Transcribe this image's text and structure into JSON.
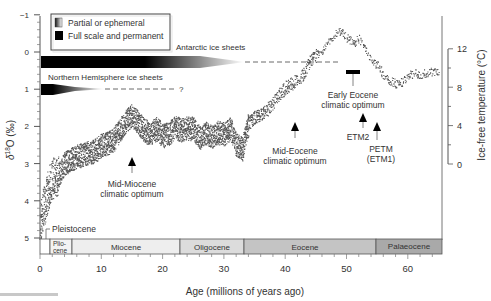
{
  "chart_data": {
    "type": "scatter",
    "title": "",
    "xlabel": "Age (millions of years ago)",
    "ylabel": "δ18O (‰)",
    "y2label": "Ice-free temperature (°C)",
    "xlim": [
      0,
      65.5
    ],
    "ylim": [
      5,
      -1
    ],
    "y2lim": [
      0,
      12
    ],
    "x_ticks": [
      0,
      10,
      20,
      30,
      40,
      50,
      60
    ],
    "y_ticks": [
      -1,
      0,
      1,
      2,
      3,
      4,
      5
    ],
    "y2_ticks": [
      0,
      4,
      8,
      12
    ],
    "grid": false,
    "legend": {
      "position": "upper-left",
      "entries": [
        {
          "label": "Partial or ephemeral",
          "symbol": "gradient-box"
        },
        {
          "label": "Full scale and permanent",
          "symbol": "black-box"
        }
      ]
    },
    "series": [
      {
        "name": "Benthic δ18O composite",
        "x": [
          0,
          0.5,
          1,
          1.5,
          2,
          3,
          4,
          5,
          6,
          7,
          8,
          9,
          10,
          11,
          12,
          13,
          14,
          15,
          16,
          17,
          18,
          19,
          20,
          21,
          22,
          23,
          24,
          25,
          26,
          27,
          28,
          29,
          30,
          31,
          32,
          33,
          34,
          35,
          36,
          37,
          38,
          39,
          40,
          41,
          42,
          43,
          44,
          45,
          46,
          47,
          48,
          49,
          50,
          51,
          52,
          53,
          54,
          55,
          56,
          57,
          58,
          59,
          60,
          61,
          62,
          63,
          64,
          65
        ],
        "values": [
          4.6,
          4.2,
          3.9,
          3.6,
          3.4,
          3.3,
          3.0,
          2.9,
          2.8,
          2.75,
          2.7,
          2.65,
          2.5,
          2.45,
          2.35,
          2.1,
          1.85,
          1.7,
          1.9,
          2.1,
          2.2,
          2.05,
          2.25,
          2.2,
          2.0,
          2.1,
          2.05,
          2.05,
          2.3,
          2.15,
          2.3,
          2.15,
          2.2,
          2.05,
          2.5,
          2.6,
          1.9,
          1.75,
          1.7,
          1.55,
          1.35,
          1.15,
          0.95,
          0.85,
          0.75,
          0.6,
          0.25,
          0.1,
          -0.05,
          -0.25,
          -0.45,
          -0.55,
          -0.4,
          -0.25,
          -0.35,
          -0.1,
          0.2,
          0.35,
          0.6,
          0.75,
          0.85,
          0.8,
          0.65,
          0.55,
          0.6,
          0.55,
          0.5,
          0.55
        ]
      }
    ],
    "ice_sheets": [
      {
        "label": "Antarctic ice sheets",
        "full_scale_from": 0,
        "full_scale_to": 26,
        "ephemeral_to": 34,
        "dashed_to": 49,
        "y_delta": 0.3
      },
      {
        "label": "Northern Hemisphere ice sheets",
        "full_scale_from": 0,
        "full_scale_to": 2.7,
        "ephemeral_to": 10,
        "dashed_to": 23,
        "y_delta": 0.85,
        "uncertain_marker": "?"
      }
    ],
    "bar_marker": {
      "label": "Early Eocene climatic optimum",
      "x_from": 50.5,
      "x_to": 53,
      "y": 0.5
    },
    "annotations": [
      {
        "text": "Mid-Miocene climatic optimum",
        "x": 15,
        "arrow": true
      },
      {
        "text": "Mid-Eocene climatic optimum",
        "x": 41.5,
        "arrow": true
      },
      {
        "text": "Early Eocene climatic optimum",
        "x": 51.5,
        "arrow": false
      },
      {
        "text": "ETM2",
        "x": 53.5,
        "arrow": true
      },
      {
        "text": "PETM (ETM1)",
        "x": 55.5,
        "arrow": true
      },
      {
        "text": "Pleistocene",
        "x": 1.3,
        "arrow": false
      }
    ],
    "epochs": [
      {
        "name": "Pleistocene",
        "from": 0,
        "to": 1.8
      },
      {
        "name": "Pliocene",
        "label": "Plio-\ncene",
        "from": 1.8,
        "to": 5.3
      },
      {
        "name": "Miocene",
        "from": 5.3,
        "to": 23
      },
      {
        "name": "Oligocene",
        "from": 23,
        "to": 33.8
      },
      {
        "name": "Eocene",
        "from": 33.8,
        "to": 55
      },
      {
        "name": "Palaeocene",
        "from": 55,
        "to": 65.5
      }
    ]
  },
  "labels": {
    "legend_partial": "Partial or ephemeral",
    "legend_full": "Full scale and permanent",
    "antarctic": "Antarctic ice sheets",
    "northern": "Northern Hemisphere ice sheets",
    "question": "?",
    "mid_miocene_1": "Mid-Miocene",
    "mid_miocene_2": "climatic optimum",
    "mid_eocene_1": "Mid-Eocene",
    "mid_eocene_2": "climatic optimum",
    "early_eocene_1": "Early Eocene",
    "early_eocene_2": "climatic optimum",
    "etm2": "ETM2",
    "petm_1": "PETM",
    "petm_2": "(ETM1)",
    "pleistocene": "Pleistocene",
    "pliocene_1": "Plio-",
    "pliocene_2": "cene",
    "miocene": "Miocene",
    "oligocene": "Oligocene",
    "eocene": "Eocene",
    "palaeocene": "Palaeocene",
    "xlabel": "Age (millions of years ago)",
    "ylabel_main": "δ",
    "ylabel_sup": "18",
    "ylabel_rest": "O (‰)",
    "y2label": "Ice-free temperature (°C)",
    "xticks": [
      "0",
      "10",
      "20",
      "30",
      "40",
      "50",
      "60"
    ],
    "yticks": [
      "−1",
      "0",
      "1",
      "2",
      "3",
      "4",
      "5"
    ],
    "y2ticks": [
      "12",
      "8",
      "4",
      "0"
    ]
  },
  "colors": {
    "data": "#3a3a3a",
    "axis": "#555555",
    "ice_full": "#000000",
    "epoch_light": "#ececec",
    "epoch_mid": "#d9d9d9",
    "epoch_dark": "#bdbdbd",
    "epoch_darker": "#a9a9a9"
  }
}
